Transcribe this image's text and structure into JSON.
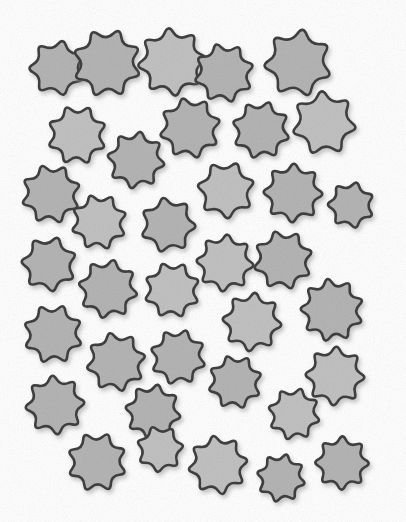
{
  "image": {
    "kind": "star-array-counting-stimulus",
    "width": 406,
    "height": 522,
    "background_color": "#ffffff",
    "object_name": "star",
    "object_count": 36,
    "alt_text": "A white page scattered with thirty-six gray many-pointed stars"
  },
  "style": {
    "fill_color": "#b5b5b5",
    "fill_color_light": "#c2c2c2",
    "outline_color": "#3f3f3f",
    "outline_width": 2.6,
    "shadow_color": "#9a9a9a",
    "shadow_offset_x": 2,
    "shadow_offset_y": 3,
    "shadow_blur": 2.5,
    "texture": "paper-grain",
    "texture_opacity": 0.3
  },
  "chart_data": {
    "type": "scatter",
    "title": "",
    "xlabel": "",
    "ylabel": "",
    "xlim": [
      0,
      406
    ],
    "ylim": [
      0,
      522
    ],
    "grid": false,
    "legend": "none",
    "marker": "star",
    "count": 36,
    "stars": [
      {
        "id": 1,
        "cx": 57,
        "cy": 68,
        "r": 31,
        "points": 7,
        "inner": 0.6,
        "rot": 12
      },
      {
        "id": 2,
        "cx": 107,
        "cy": 63,
        "r": 38,
        "points": 8,
        "inner": 0.6,
        "rot": 20
      },
      {
        "id": 3,
        "cx": 172,
        "cy": 62,
        "r": 38,
        "points": 8,
        "inner": 0.6,
        "rot": -6
      },
      {
        "id": 4,
        "cx": 224,
        "cy": 73,
        "r": 33,
        "points": 8,
        "inner": 0.61,
        "rot": 30
      },
      {
        "id": 5,
        "cx": 298,
        "cy": 63,
        "r": 38,
        "points": 7,
        "inner": 0.58,
        "rot": 8
      },
      {
        "id": 6,
        "cx": 77,
        "cy": 135,
        "r": 33,
        "points": 8,
        "inner": 0.6,
        "rot": 24
      },
      {
        "id": 7,
        "cx": 190,
        "cy": 128,
        "r": 34,
        "points": 8,
        "inner": 0.6,
        "rot": -14
      },
      {
        "id": 8,
        "cx": 261,
        "cy": 130,
        "r": 32,
        "points": 8,
        "inner": 0.61,
        "rot": 16
      },
      {
        "id": 9,
        "cx": 324,
        "cy": 123,
        "r": 36,
        "points": 7,
        "inner": 0.58,
        "rot": -4
      },
      {
        "id": 10,
        "cx": 136,
        "cy": 160,
        "r": 32,
        "points": 8,
        "inner": 0.6,
        "rot": 9
      },
      {
        "id": 11,
        "cx": 51,
        "cy": 194,
        "r": 33,
        "points": 8,
        "inner": 0.6,
        "rot": -18
      },
      {
        "id": 12,
        "cx": 226,
        "cy": 190,
        "r": 32,
        "points": 7,
        "inner": 0.59,
        "rot": 22
      },
      {
        "id": 13,
        "cx": 293,
        "cy": 193,
        "r": 33,
        "points": 8,
        "inner": 0.6,
        "rot": 2
      },
      {
        "id": 14,
        "cx": 351,
        "cy": 205,
        "r": 26,
        "points": 7,
        "inner": 0.6,
        "rot": 14
      },
      {
        "id": 15,
        "cx": 99,
        "cy": 222,
        "r": 31,
        "points": 8,
        "inner": 0.6,
        "rot": 27
      },
      {
        "id": 16,
        "cx": 168,
        "cy": 225,
        "r": 31,
        "points": 7,
        "inner": 0.59,
        "rot": -10
      },
      {
        "id": 17,
        "cx": 49,
        "cy": 264,
        "r": 31,
        "points": 7,
        "inner": 0.59,
        "rot": 18
      },
      {
        "id": 18,
        "cx": 225,
        "cy": 263,
        "r": 32,
        "points": 8,
        "inner": 0.6,
        "rot": 5
      },
      {
        "id": 19,
        "cx": 283,
        "cy": 260,
        "r": 33,
        "points": 8,
        "inner": 0.6,
        "rot": -16
      },
      {
        "id": 20,
        "cx": 108,
        "cy": 289,
        "r": 33,
        "points": 8,
        "inner": 0.6,
        "rot": 11
      },
      {
        "id": 21,
        "cx": 172,
        "cy": 290,
        "r": 31,
        "points": 8,
        "inner": 0.61,
        "rot": 25
      },
      {
        "id": 22,
        "cx": 332,
        "cy": 310,
        "r": 35,
        "points": 9,
        "inner": 0.61,
        "rot": -8
      },
      {
        "id": 23,
        "cx": 53,
        "cy": 334,
        "r": 33,
        "points": 8,
        "inner": 0.6,
        "rot": 20
      },
      {
        "id": 24,
        "cx": 252,
        "cy": 322,
        "r": 33,
        "points": 8,
        "inner": 0.6,
        "rot": 6
      },
      {
        "id": 25,
        "cx": 116,
        "cy": 362,
        "r": 33,
        "points": 8,
        "inner": 0.6,
        "rot": -12
      },
      {
        "id": 26,
        "cx": 178,
        "cy": 357,
        "r": 31,
        "points": 8,
        "inner": 0.6,
        "rot": 17
      },
      {
        "id": 27,
        "cx": 335,
        "cy": 376,
        "r": 33,
        "points": 8,
        "inner": 0.6,
        "rot": 3
      },
      {
        "id": 28,
        "cx": 235,
        "cy": 382,
        "r": 30,
        "points": 8,
        "inner": 0.6,
        "rot": 28
      },
      {
        "id": 29,
        "cx": 55,
        "cy": 405,
        "r": 33,
        "points": 8,
        "inner": 0.6,
        "rot": -5
      },
      {
        "id": 30,
        "cx": 294,
        "cy": 414,
        "r": 29,
        "points": 8,
        "inner": 0.6,
        "rot": 15
      },
      {
        "id": 31,
        "cx": 153,
        "cy": 412,
        "r": 31,
        "points": 8,
        "inner": 0.6,
        "rot": 10
      },
      {
        "id": 32,
        "cx": 97,
        "cy": 462,
        "r": 33,
        "points": 8,
        "inner": 0.6,
        "rot": 21
      },
      {
        "id": 33,
        "cx": 218,
        "cy": 465,
        "r": 33,
        "points": 8,
        "inner": 0.6,
        "rot": -9
      },
      {
        "id": 34,
        "cx": 281,
        "cy": 478,
        "r": 27,
        "points": 8,
        "inner": 0.6,
        "rot": 13
      },
      {
        "id": 35,
        "cx": 342,
        "cy": 463,
        "r": 30,
        "points": 8,
        "inner": 0.6,
        "rot": 1
      },
      {
        "id": 36,
        "cx": 160,
        "cy": 449,
        "r": 26,
        "points": 7,
        "inner": 0.6,
        "rot": -20
      }
    ]
  }
}
